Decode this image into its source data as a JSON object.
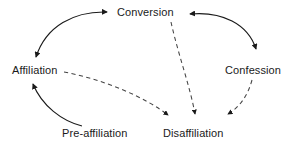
{
  "diagram": {
    "type": "directed-graph",
    "background_color": "#ffffff",
    "stroke_color": "#1a1a1a",
    "dashed_stroke_color": "#555555",
    "nodes": [
      {
        "id": "conversion",
        "label": "Conversion",
        "x": 145,
        "y": 13
      },
      {
        "id": "affiliation",
        "label": "Affiliation",
        "x": 37,
        "y": 71
      },
      {
        "id": "confession",
        "label": "Confession",
        "x": 255,
        "y": 71
      },
      {
        "id": "preaffiliation",
        "label": "Pre-affiliation",
        "x": 98,
        "y": 134
      },
      {
        "id": "disaffiliation",
        "label": "Disaffiliation",
        "x": 195,
        "y": 134
      }
    ],
    "edges": [
      {
        "id": "affiliation-conversion",
        "from": "affiliation",
        "to": "conversion",
        "style": "solid",
        "direction": "bidirectional"
      },
      {
        "id": "conversion-confession",
        "from": "conversion",
        "to": "confession",
        "style": "solid",
        "direction": "bidirectional"
      },
      {
        "id": "preaffil-affiliation",
        "from": "preaffiliation",
        "to": "affiliation",
        "style": "solid",
        "direction": "forward"
      },
      {
        "id": "affiliation-disaffil",
        "from": "affiliation",
        "to": "disaffiliation",
        "style": "dashed",
        "direction": "forward"
      },
      {
        "id": "conversion-disaffil",
        "from": "conversion",
        "to": "disaffiliation",
        "style": "dashed",
        "direction": "forward"
      },
      {
        "id": "confession-disaffil",
        "from": "confession",
        "to": "disaffiliation",
        "style": "dashed",
        "direction": "forward"
      }
    ]
  }
}
